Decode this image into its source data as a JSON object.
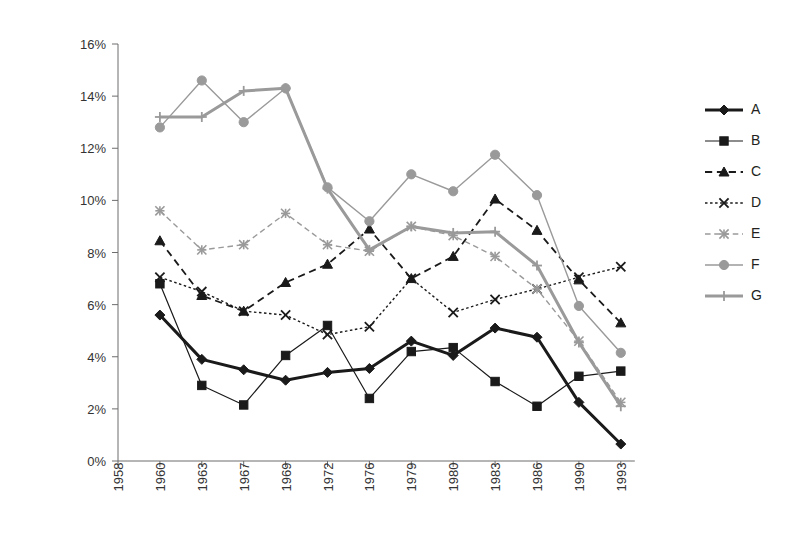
{
  "chart_data": {
    "type": "line",
    "title": "",
    "xlabel": "",
    "ylabel": "",
    "ylim": [
      0,
      16
    ],
    "ytick_labels": [
      "0%",
      "2%",
      "4%",
      "6%",
      "8%",
      "10%",
      "12%",
      "14%",
      "16%"
    ],
    "ytick_values": [
      0,
      2,
      4,
      6,
      8,
      10,
      12,
      14,
      16
    ],
    "grid": false,
    "legend_position": "right",
    "categories": [
      "1958",
      "1960",
      "1963",
      "1967",
      "1969",
      "1972",
      "1976",
      "1979",
      "1980",
      "1983",
      "1986",
      "1990",
      "1993"
    ],
    "series": [
      {
        "name": "A",
        "marker": "diamond",
        "line_style": "solid",
        "line_width": 3,
        "color": "#1a1a1a",
        "x": [
          "1960",
          "1963",
          "1967",
          "1969",
          "1972",
          "1976",
          "1979",
          "1980",
          "1983",
          "1986",
          "1990",
          "1993"
        ],
        "values": [
          5.6,
          3.9,
          3.5,
          3.1,
          3.4,
          3.55,
          4.6,
          4.05,
          5.1,
          4.75,
          2.25,
          0.65
        ]
      },
      {
        "name": "B",
        "marker": "square",
        "line_style": "solid",
        "line_width": 1.2,
        "color": "#1a1a1a",
        "x": [
          "1960",
          "1963",
          "1967",
          "1969",
          "1972",
          "1976",
          "1979",
          "1980",
          "1983",
          "1986",
          "1990",
          "1993"
        ],
        "values": [
          6.8,
          2.9,
          2.15,
          4.05,
          5.2,
          2.4,
          4.2,
          4.35,
          3.05,
          2.1,
          3.25,
          3.45
        ]
      },
      {
        "name": "C",
        "marker": "triangle",
        "line_style": "dashed",
        "line_width": 1.8,
        "color": "#1a1a1a",
        "x": [
          "1960",
          "1963",
          "1967",
          "1969",
          "1972",
          "1976",
          "1979",
          "1980",
          "1983",
          "1986",
          "1990",
          "1993"
        ],
        "values": [
          8.45,
          6.35,
          5.75,
          6.85,
          7.55,
          8.9,
          7.0,
          7.85,
          10.05,
          8.85,
          6.95,
          5.3
        ]
      },
      {
        "name": "D",
        "marker": "x",
        "line_style": "dotted",
        "line_width": 1.4,
        "color": "#1a1a1a",
        "x": [
          "1960",
          "1963",
          "1967",
          "1969",
          "1972",
          "1976",
          "1979",
          "1980",
          "1983",
          "1986",
          "1990",
          "1993"
        ],
        "values": [
          7.05,
          6.5,
          5.75,
          5.6,
          4.85,
          5.15,
          7.0,
          5.7,
          6.2,
          6.6,
          7.05,
          7.45
        ]
      },
      {
        "name": "E",
        "marker": "star",
        "line_style": "dashed",
        "line_width": 1.4,
        "color": "#9a9a9a",
        "x": [
          "1960",
          "1963",
          "1967",
          "1969",
          "1972",
          "1976",
          "1979",
          "1980",
          "1983",
          "1986",
          "1990",
          "1993"
        ],
        "values": [
          9.6,
          8.1,
          8.3,
          9.5,
          8.3,
          8.05,
          9.0,
          8.65,
          7.85,
          6.6,
          4.6,
          2.25
        ]
      },
      {
        "name": "F",
        "marker": "circle",
        "line_style": "solid",
        "line_width": 1.4,
        "color": "#9a9a9a",
        "x": [
          "1960",
          "1963",
          "1967",
          "1969",
          "1972",
          "1976",
          "1979",
          "1980",
          "1983",
          "1986",
          "1990",
          "1993"
        ],
        "values": [
          12.8,
          14.6,
          13.0,
          14.3,
          10.5,
          9.2,
          11.0,
          10.35,
          11.75,
          10.2,
          5.95,
          4.15
        ]
      },
      {
        "name": "G",
        "marker": "plus",
        "line_style": "solid",
        "line_width": 3,
        "color": "#9a9a9a",
        "x": [
          "1960",
          "1963",
          "1967",
          "1969",
          "1972",
          "1976",
          "1979",
          "1980",
          "1983",
          "1986",
          "1990",
          "1993"
        ],
        "values": [
          13.2,
          13.2,
          14.2,
          14.3,
          10.45,
          8.1,
          9.0,
          8.75,
          8.8,
          7.5,
          4.55,
          2.1
        ]
      }
    ]
  },
  "legend": {
    "entries": [
      {
        "label": "A"
      },
      {
        "label": "B"
      },
      {
        "label": "C"
      },
      {
        "label": "D"
      },
      {
        "label": "E"
      },
      {
        "label": "F"
      },
      {
        "label": "G"
      }
    ]
  }
}
